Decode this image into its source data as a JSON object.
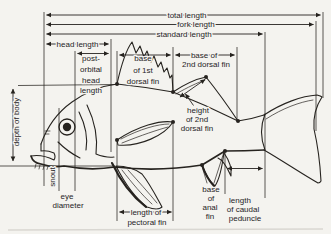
{
  "colors": {
    "ink": "#26231f",
    "background": "#f4f3ef"
  },
  "labels": {
    "total_length": "total length",
    "fork_length": "fork length",
    "standard_length": "standard length",
    "head_length": "head length",
    "post_orbital_head_length": {
      "lines": [
        "post-",
        "orbital",
        "head",
        "length"
      ]
    },
    "base_of_1st_dorsal_fin": {
      "lines": [
        "base",
        "of 1st",
        "dorsal fin"
      ]
    },
    "base_of_2nd_dorsal_fin": {
      "lines": [
        "base of",
        "2nd dorsal fin"
      ]
    },
    "height_of_2nd_dorsal_fin": {
      "lines": [
        "height",
        "of 2nd",
        "dorsal fin"
      ]
    },
    "depth_of_body": "depth of body",
    "snout": "snout",
    "eye_diameter": {
      "lines": [
        "eye",
        "diameter"
      ]
    },
    "length_of_pectoral_fin": {
      "lines": [
        "length of",
        "pectoral fin"
      ]
    },
    "base_of_anal_fin": {
      "lines": [
        "base",
        "of",
        "anal",
        "fin"
      ]
    },
    "length_of_caudal_peduncle": {
      "lines": [
        "length",
        "of caudal",
        "peduncle"
      ]
    }
  }
}
